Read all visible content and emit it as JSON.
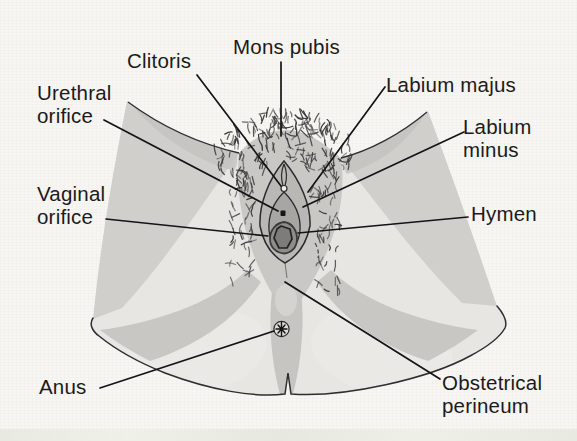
{
  "figure": {
    "kind": "anatomical-line-diagram",
    "labels": [
      {
        "id": "mons-pubis",
        "text": "Mons pubis"
      },
      {
        "id": "clitoris",
        "text": "Clitoris"
      },
      {
        "id": "urethral-orifice",
        "text": "Urethral\norifice"
      },
      {
        "id": "vaginal-orifice",
        "text": "Vaginal\norifice"
      },
      {
        "id": "anus",
        "text": "Anus"
      },
      {
        "id": "labium-majus",
        "text": "Labium majus"
      },
      {
        "id": "labium-minus",
        "text": "Labium\nminus"
      },
      {
        "id": "hymen",
        "text": "Hymen"
      },
      {
        "id": "obstetrical-perineum",
        "text": "Obstetrical\nperineum"
      }
    ],
    "markers": {
      "anus_marker": "asterisk-star-in-circle"
    },
    "colors": {
      "paper": "#f7f6f2",
      "skin_light": "#e7e6e3",
      "skin_mid": "#d0cfcc",
      "skin_dark": "#c8c7c4",
      "vulva_gray": "#b9b8b5",
      "orifice_dark": "#8e8d8a",
      "hair": "#383836",
      "outline": "#2e2e2e",
      "leader_line": "#141414",
      "text": "#1b1b1b",
      "scan_strip": "#e6e8de"
    }
  }
}
